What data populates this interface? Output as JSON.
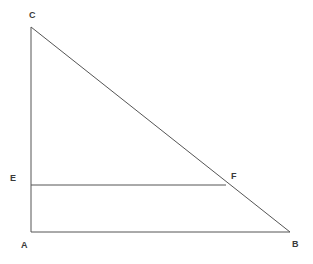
{
  "figure": {
    "kind": "geometry-diagram",
    "background_color": "#ffffff",
    "line_color": "#555555",
    "label_color": "#3a3a3a",
    "width": 313,
    "height": 264
  },
  "points": {
    "A": {
      "label": "A",
      "x": 31,
      "y": 232
    },
    "B": {
      "label": "B",
      "x": 290,
      "y": 232
    },
    "C": {
      "label": "C",
      "x": 31,
      "y": 27
    },
    "E": {
      "label": "E",
      "x": 31,
      "y": 185
    },
    "F": {
      "label": "F",
      "x": 226,
      "y": 185
    }
  },
  "segments": [
    {
      "name": "AC",
      "from": "A",
      "to": "C"
    },
    {
      "name": "AB",
      "from": "A",
      "to": "B"
    },
    {
      "name": "CB",
      "from": "C",
      "to": "B"
    },
    {
      "name": "EF",
      "from": "E",
      "to": "F"
    }
  ]
}
